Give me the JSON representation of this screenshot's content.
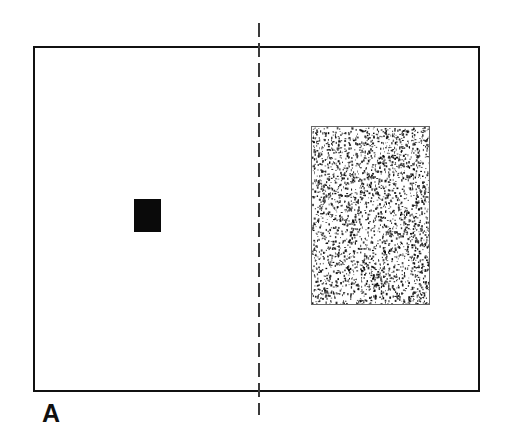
{
  "figure": {
    "panel_label": "A",
    "background_color": "#ffffff",
    "width": 509,
    "height": 448
  },
  "frame": {
    "name": "visual-field-frame",
    "stroke_color": "#111111",
    "stroke_width": 2,
    "x": 33,
    "y": 46,
    "width": 447,
    "height": 346
  },
  "midline": {
    "name": "vertical-dashed-midline",
    "orientation": "vertical",
    "stroke_color": "#3a3a3a",
    "stroke_width": 2,
    "dash_length": 14,
    "gap_length": 6,
    "x": 259,
    "y_start": 23,
    "y_end": 415
  },
  "solid_square": {
    "name": "solid-black-square",
    "fill_color": "#0a0a0a",
    "x": 134,
    "y": 199,
    "width": 27,
    "height": 33
  },
  "stipple_rect": {
    "name": "stippled-rectangle",
    "border_color": "#666666",
    "border_width": 1,
    "fill_color": "#ffffff",
    "dot_color": "#111111",
    "x": 311,
    "y": 126,
    "width": 119,
    "height": 179,
    "dot_count": 2600,
    "texture": "random-stipple"
  }
}
